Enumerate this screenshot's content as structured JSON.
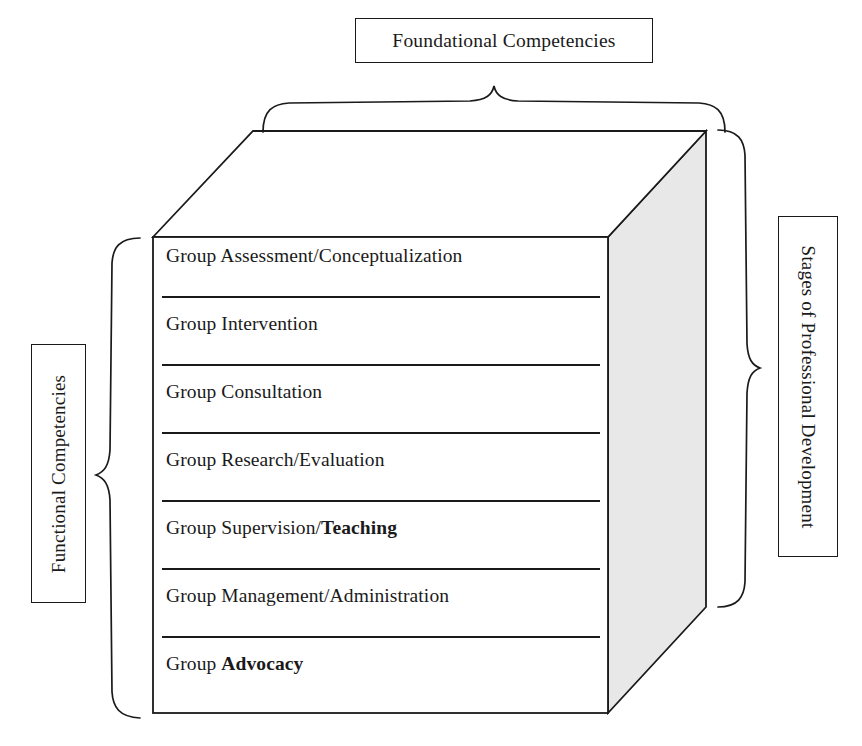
{
  "diagram": {
    "title_top": "Foundational Competencies",
    "label_left": "Functional Competencies",
    "label_right": "Stages of Professional Development",
    "cube": {
      "side_face_color": "#e8e8e8",
      "line_color": "#1a1a1a",
      "rows": [
        {
          "prefix": "Group Assessment/Conceptualization",
          "bold": ""
        },
        {
          "prefix": "Group Intervention",
          "bold": ""
        },
        {
          "prefix": "Group Consultation",
          "bold": ""
        },
        {
          "prefix": "Group Research/Evaluation",
          "bold": ""
        },
        {
          "prefix": "Group Supervision/",
          "bold": "Teaching"
        },
        {
          "prefix": "Group Management/Administration",
          "bold": ""
        },
        {
          "prefix": "Group ",
          "bold": "Advocacy"
        }
      ]
    }
  }
}
